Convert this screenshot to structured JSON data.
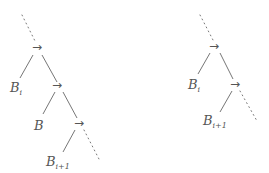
{
  "diagram": {
    "left_tree": {
      "nodes": [
        {
          "symbol": "→"
        },
        {
          "symbol": "→"
        },
        {
          "symbol": "→"
        }
      ],
      "leaves": [
        {
          "base": "B",
          "sub": "i"
        },
        {
          "base": "B",
          "sub": ""
        },
        {
          "base": "B",
          "sub": "i+1"
        }
      ]
    },
    "right_tree": {
      "nodes": [
        {
          "symbol": "→"
        },
        {
          "symbol": "→"
        }
      ],
      "leaves": [
        {
          "base": "B",
          "sub": "i"
        },
        {
          "base": "B",
          "sub": "i+1"
        }
      ]
    },
    "colors": {
      "line": "#666666",
      "text": "#555555"
    }
  }
}
